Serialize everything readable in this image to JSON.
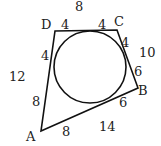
{
  "diagram": {
    "type": "tangential quadrilateral with inscribed circle",
    "vertices": {
      "A": {
        "label": "A",
        "x": 41,
        "y": 131
      },
      "B": {
        "label": "B",
        "x": 138,
        "y": 88
      },
      "C": {
        "label": "C",
        "x": 117,
        "y": 30
      },
      "D": {
        "label": "D",
        "x": 55,
        "y": 31
      }
    },
    "circle": {
      "cx": 90,
      "cy": 67,
      "r": 36
    },
    "tangent_segments": {
      "D_top": "4",
      "C_top": "4",
      "C_right": "4",
      "B_right": "6",
      "B_bottom": "6",
      "A_bottom": "8",
      "A_left": "8",
      "D_left": "4"
    },
    "side_lengths": {
      "DC": "8",
      "CB": "10",
      "BA": "14",
      "AD": "12"
    },
    "colors": {
      "stroke": "#111111",
      "text": "#222222",
      "background": "#ffffff"
    }
  }
}
